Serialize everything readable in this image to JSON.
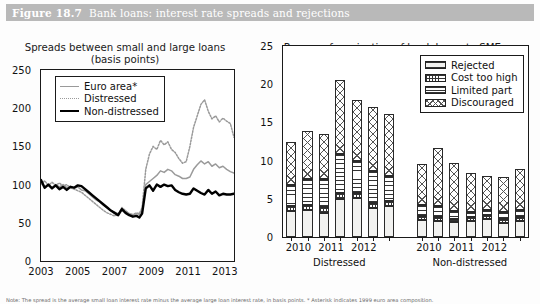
{
  "figure": {
    "number": "Figure 18.7",
    "title": "Bank loans: interest rate spreads and rejections",
    "header_color": "#b9b9b9",
    "footnote": "Note: The spread is the average small loan interest rate minus the average large loan interest rate, in basis points. * Asterisk indicates 1999 euro area composition."
  },
  "chart_data": [
    {
      "id": "left",
      "type": "line",
      "title": "Spreads between small and large loans",
      "subtitle": "(basis points)",
      "xlabel": "",
      "ylabel": "",
      "ylim": [
        0,
        250
      ],
      "yticks": [
        0,
        50,
        100,
        150,
        200,
        250
      ],
      "xlim": [
        2003,
        2013.5
      ],
      "xticks": [
        2003,
        2005,
        2007,
        2009,
        2011,
        2013
      ],
      "grid": false,
      "legend_position": "top-left",
      "series": [
        {
          "name": "Euro area*",
          "color": "#9a9a9a",
          "style": "solid",
          "width": 1.5,
          "x": [
            2003.0,
            2003.2,
            2003.4,
            2003.6,
            2003.8,
            2004.0,
            2004.2,
            2004.4,
            2004.6,
            2004.8,
            2005.0,
            2005.2,
            2005.4,
            2005.6,
            2005.8,
            2006.0,
            2006.2,
            2006.4,
            2006.6,
            2006.8,
            2007.0,
            2007.2,
            2007.4,
            2007.6,
            2007.8,
            2008.0,
            2008.2,
            2008.35,
            2008.5,
            2008.7,
            2008.9,
            2009.1,
            2009.3,
            2009.5,
            2009.7,
            2009.9,
            2010.1,
            2010.3,
            2010.5,
            2010.7,
            2010.9,
            2011.1,
            2011.3,
            2011.5,
            2011.7,
            2011.9,
            2012.1,
            2012.3,
            2012.5,
            2012.7,
            2012.9,
            2013.1,
            2013.3,
            2013.5
          ],
          "y": [
            104,
            95,
            99,
            96,
            100,
            97,
            100,
            96,
            98,
            95,
            97,
            93,
            92,
            88,
            84,
            80,
            77,
            73,
            70,
            66,
            64,
            62,
            68,
            64,
            62,
            60,
            62,
            61,
            66,
            100,
            104,
            108,
            112,
            118,
            116,
            120,
            118,
            113,
            111,
            108,
            108,
            110,
            120,
            126,
            131,
            127,
            130,
            124,
            127,
            122,
            124,
            120,
            117,
            115
          ]
        },
        {
          "name": "Distressed",
          "color": "#9a9a9a",
          "style": "dotted",
          "width": 1.5,
          "x": [
            2003.0,
            2003.2,
            2003.4,
            2003.6,
            2003.8,
            2004.0,
            2004.2,
            2004.4,
            2004.6,
            2004.8,
            2005.0,
            2005.2,
            2005.4,
            2005.6,
            2005.8,
            2006.0,
            2006.2,
            2006.4,
            2006.6,
            2006.8,
            2007.0,
            2007.2,
            2007.4,
            2007.6,
            2007.8,
            2008.0,
            2008.2,
            2008.35,
            2008.5,
            2008.7,
            2008.9,
            2009.1,
            2009.3,
            2009.5,
            2009.7,
            2009.9,
            2010.1,
            2010.3,
            2010.5,
            2010.7,
            2010.9,
            2011.1,
            2011.3,
            2011.5,
            2011.7,
            2011.9,
            2012.1,
            2012.3,
            2012.5,
            2012.7,
            2012.9,
            2013.1,
            2013.3,
            2013.5
          ],
          "y": [
            100,
            105,
            99,
            103,
            99,
            102,
            98,
            100,
            96,
            94,
            92,
            90,
            86,
            82,
            78,
            74,
            70,
            66,
            63,
            61,
            59,
            61,
            70,
            66,
            62,
            61,
            63,
            62,
            70,
            120,
            140,
            150,
            146,
            158,
            152,
            156,
            146,
            142,
            134,
            128,
            130,
            150,
            175,
            190,
            205,
            211,
            196,
            186,
            190,
            182,
            187,
            183,
            180,
            162
          ]
        },
        {
          "name": "Non-distressed",
          "color": "#000000",
          "style": "solid",
          "width": 2.4,
          "x": [
            2003.0,
            2003.2,
            2003.4,
            2003.6,
            2003.8,
            2004.0,
            2004.2,
            2004.4,
            2004.6,
            2004.8,
            2005.0,
            2005.2,
            2005.4,
            2005.6,
            2005.8,
            2006.0,
            2006.2,
            2006.4,
            2006.6,
            2006.8,
            2007.0,
            2007.2,
            2007.4,
            2007.6,
            2007.8,
            2008.0,
            2008.2,
            2008.35,
            2008.5,
            2008.7,
            2008.9,
            2009.1,
            2009.3,
            2009.5,
            2009.7,
            2009.9,
            2010.1,
            2010.3,
            2010.5,
            2010.7,
            2010.9,
            2011.1,
            2011.3,
            2011.5,
            2011.7,
            2011.9,
            2012.1,
            2012.3,
            2012.5,
            2012.7,
            2012.9,
            2013.1,
            2013.3,
            2013.5
          ],
          "y": [
            106,
            96,
            100,
            95,
            99,
            94,
            97,
            93,
            97,
            96,
            99,
            98,
            94,
            90,
            86,
            82,
            78,
            74,
            70,
            66,
            63,
            60,
            68,
            63,
            60,
            58,
            59,
            57,
            62,
            95,
            99,
            92,
            100,
            97,
            100,
            98,
            99,
            93,
            90,
            88,
            87,
            88,
            95,
            92,
            89,
            87,
            93,
            88,
            91,
            86,
            88,
            87,
            87,
            88
          ]
        }
      ]
    },
    {
      "id": "right",
      "type": "bar",
      "subtype": "stacked",
      "title": "Reasons for rejection of bank loans to SMEs",
      "subtitle": "(% of unfulfilled demands)",
      "xlabel": "",
      "ylabel": "",
      "ylim": [
        0,
        25
      ],
      "yticks": [
        0,
        5,
        10,
        15,
        20,
        25
      ],
      "grid": false,
      "legend_position": "top-right",
      "groups": [
        {
          "name": "Distressed",
          "xticks": [
            "2010",
            "2011",
            "2012"
          ]
        },
        {
          "name": "Non-distressed",
          "xticks": [
            "2010",
            "2011",
            "2012"
          ]
        }
      ],
      "stack_order": [
        "Rejected",
        "Cost too high",
        "Limited part",
        "Discouraged"
      ],
      "series": [
        {
          "name": "Rejected",
          "pattern": "pat-rejected",
          "values": [
            3.4,
            3.6,
            3.2,
            5.0,
            5.1,
            3.8,
            4.0,
            2.2,
            2.1,
            1.9,
            2.1,
            2.4,
            1.8,
            2.1
          ]
        },
        {
          "name": "Cost too high",
          "pattern": "pat-cost",
          "values": [
            0.7,
            0.6,
            0.7,
            0.7,
            0.6,
            0.7,
            0.7,
            0.5,
            0.5,
            0.4,
            0.5,
            0.5,
            0.5,
            0.5
          ]
        },
        {
          "name": "Limited part",
          "pattern": "pat-limited",
          "values": [
            2.7,
            3.4,
            3.7,
            5.2,
            4.2,
            4.1,
            3.3,
            1.5,
            1.4,
            1.1,
            0.7,
            0.6,
            1.0,
            0.9
          ]
        },
        {
          "name": "Discouraged",
          "pattern": "pat-discouraged",
          "values": [
            5.7,
            6.3,
            5.9,
            9.6,
            8.0,
            8.4,
            8.1,
            5.3,
            7.6,
            6.3,
            5.1,
            4.5,
            4.6,
            5.4
          ]
        }
      ],
      "bar_totals": [
        12.5,
        13.9,
        13.5,
        20.5,
        17.9,
        17.0,
        16.1,
        9.5,
        11.6,
        9.7,
        8.4,
        8.0,
        7.9,
        8.9
      ],
      "bar_count": 14
    }
  ]
}
